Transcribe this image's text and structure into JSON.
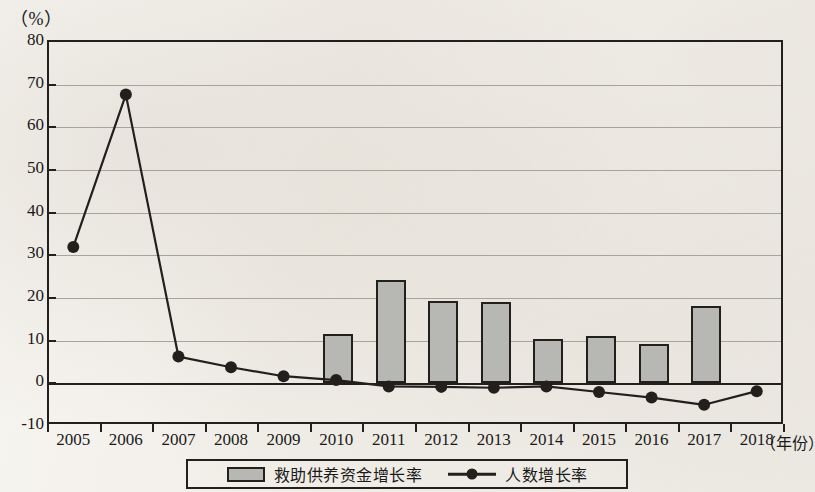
{
  "chart_data": {
    "type": "bar",
    "title": "",
    "subtitle": "",
    "unit_label": "（%）",
    "xlabel": "（年份）",
    "ylabel": "",
    "ylim": [
      -10,
      80
    ],
    "ytick_step": 10,
    "yticks": [
      "80",
      "70",
      "60",
      "50",
      "40",
      "30",
      "20",
      "10",
      "0",
      "-10"
    ],
    "grid": true,
    "legend_position": "bottom-center",
    "categories": [
      "2005",
      "2006",
      "2007",
      "2008",
      "2009",
      "2010",
      "2011",
      "2012",
      "2013",
      "2014",
      "2015",
      "2016",
      "2017",
      "2018"
    ],
    "series": [
      {
        "name": "救助供养资金增长率",
        "type": "bar",
        "color": "#b7b7b4",
        "values": [
          null,
          null,
          null,
          null,
          null,
          11.5,
          24.3,
          19.3,
          19.0,
          10.5,
          11.0,
          9.3,
          18.2,
          null
        ]
      },
      {
        "name": "人数增长率",
        "type": "line",
        "color": "#231f1c",
        "marker": "circle",
        "values": [
          31.5,
          67.2,
          5.8,
          3.3,
          1.2,
          0.3,
          -1.2,
          -1.3,
          -1.5,
          -1.2,
          -2.5,
          -3.8,
          -5.5,
          -2.3
        ]
      }
    ]
  },
  "legend": {
    "bar_label": "救助供养资金增长率",
    "line_label": "人数增长率"
  },
  "colors": {
    "bar_fill": "#b7b7b4",
    "axis": "#231f1c",
    "grid": "#a9a49b",
    "line": "#231f1c",
    "background": "#f4f2ee"
  }
}
